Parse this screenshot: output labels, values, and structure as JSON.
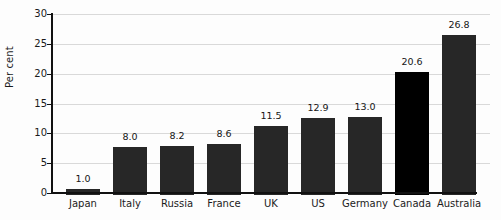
{
  "chart_data": {
    "type": "bar",
    "title": "",
    "subtitle": "",
    "xlabel": "",
    "ylabel": "Per cent",
    "ylim": [
      0,
      30
    ],
    "ytick_labels": [
      "0",
      "5",
      "10",
      "15",
      "20",
      "25",
      "30"
    ],
    "ytick_values": [
      0,
      5,
      10,
      15,
      20,
      25,
      30
    ],
    "grid": true,
    "legend": "none",
    "categories": [
      "Japan",
      "Italy",
      "Russia",
      "France",
      "UK",
      "US",
      "Germany",
      "Canada",
      "Australia"
    ],
    "values": [
      1.0,
      8.0,
      8.2,
      8.6,
      11.5,
      12.9,
      13.0,
      20.6,
      26.8
    ],
    "value_labels": [
      "1.0",
      "8.0",
      "8.2",
      "8.6",
      "11.5",
      "12.9",
      "13.0",
      "20.6",
      "26.8"
    ],
    "highlight_category": "Canada",
    "colors": {
      "bar": "#272727",
      "bar_highlight": "#000000",
      "gridline": "#d9d9d9",
      "axis": "#111111",
      "text": "#1b1b1b",
      "background": "#fdfdfd"
    }
  }
}
